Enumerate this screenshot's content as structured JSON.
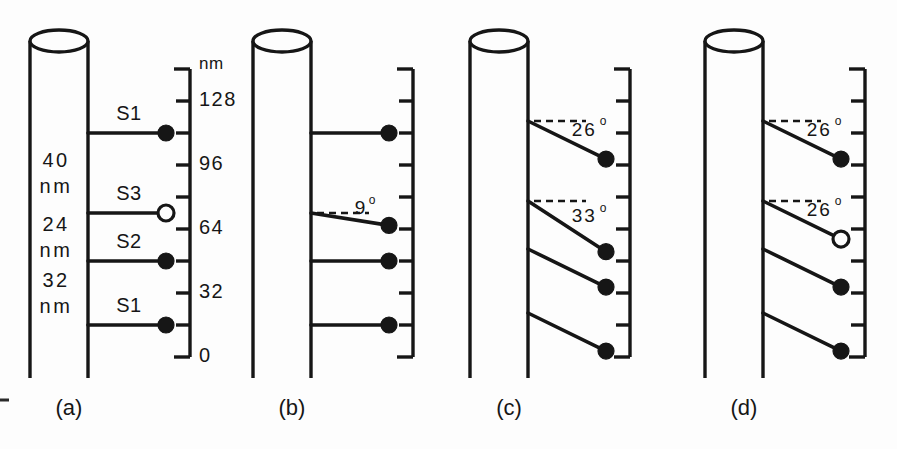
{
  "figure": {
    "background_color": "#fdfdfd",
    "ink_color": "#161616",
    "width": 897,
    "height": 449
  },
  "scale": {
    "unit_label": "nm",
    "axis_min": 0,
    "axis_max": 144,
    "tick_interval": 16,
    "labeled_ticks": [
      {
        "value": 128,
        "label": "128"
      },
      {
        "value": 96,
        "label": "96"
      },
      {
        "value": 64,
        "label": "64"
      },
      {
        "value": 32,
        "label": "32"
      },
      {
        "value": 0,
        "label": "0"
      }
    ],
    "all_tick_values": [
      0,
      16,
      32,
      48,
      64,
      80,
      96,
      112,
      128,
      144
    ]
  },
  "dimension_labels": [
    {
      "value": "40",
      "unit": "nm",
      "span_nm": 40
    },
    {
      "value": "24",
      "unit": "nm",
      "span_nm": 24
    },
    {
      "value": "32",
      "unit": "nm",
      "span_nm": 32
    }
  ],
  "panels": [
    {
      "id": "a",
      "caption": "(a)",
      "has_scale_labels": true,
      "has_segment_labels": true,
      "has_dimension_labels": true,
      "markers": [
        {
          "index": 1,
          "label": "S1",
          "level_nm": 112,
          "angle_deg": 0,
          "angle_text": "",
          "dot": "filled",
          "dashed_ref": false
        },
        {
          "index": 2,
          "label": "S3",
          "level_nm": 72,
          "angle_deg": 0,
          "angle_text": "",
          "dot": "open",
          "dashed_ref": false
        },
        {
          "index": 3,
          "label": "S2",
          "level_nm": 48,
          "angle_deg": 0,
          "angle_text": "",
          "dot": "filled",
          "dashed_ref": false
        },
        {
          "index": 4,
          "label": "S1",
          "level_nm": 16,
          "angle_deg": 0,
          "angle_text": "",
          "dot": "filled",
          "dashed_ref": false
        }
      ]
    },
    {
      "id": "b",
      "caption": "(b)",
      "has_scale_labels": false,
      "has_segment_labels": false,
      "has_dimension_labels": false,
      "markers": [
        {
          "index": 1,
          "label": "",
          "level_nm": 112,
          "angle_deg": 0,
          "angle_text": "",
          "dot": "filled",
          "dashed_ref": false
        },
        {
          "index": 2,
          "label": "",
          "level_nm": 72,
          "angle_deg": 9,
          "angle_text": "9",
          "dot": "filled",
          "dashed_ref": true
        },
        {
          "index": 3,
          "label": "",
          "level_nm": 48,
          "angle_deg": 0,
          "angle_text": "",
          "dot": "filled",
          "dashed_ref": false
        },
        {
          "index": 4,
          "label": "",
          "level_nm": 16,
          "angle_deg": 0,
          "angle_text": "",
          "dot": "filled",
          "dashed_ref": false
        }
      ]
    },
    {
      "id": "c",
      "caption": "(c)",
      "has_scale_labels": false,
      "has_segment_labels": false,
      "has_dimension_labels": false,
      "markers": [
        {
          "index": 1,
          "label": "",
          "level_nm": 118,
          "angle_deg": 26,
          "angle_text": "26",
          "dot": "filled",
          "dashed_ref": true
        },
        {
          "index": 2,
          "label": "",
          "level_nm": 78,
          "angle_deg": 33,
          "angle_text": "33",
          "dot": "filled",
          "dashed_ref": true
        },
        {
          "index": 3,
          "label": "",
          "level_nm": 54,
          "angle_deg": 26,
          "angle_text": "",
          "dot": "filled",
          "dashed_ref": false
        },
        {
          "index": 4,
          "label": "",
          "level_nm": 22,
          "angle_deg": 26,
          "angle_text": "",
          "dot": "filled",
          "dashed_ref": false
        }
      ]
    },
    {
      "id": "d",
      "caption": "(d)",
      "has_scale_labels": false,
      "has_segment_labels": false,
      "has_dimension_labels": false,
      "markers": [
        {
          "index": 1,
          "label": "",
          "level_nm": 118,
          "angle_deg": 26,
          "angle_text": "26",
          "dot": "filled",
          "dashed_ref": true
        },
        {
          "index": 2,
          "label": "",
          "level_nm": 78,
          "angle_deg": 26,
          "angle_text": "26",
          "dot": "open",
          "dashed_ref": true
        },
        {
          "index": 3,
          "label": "",
          "level_nm": 54,
          "angle_deg": 26,
          "angle_text": "",
          "dot": "filled",
          "dashed_ref": false
        },
        {
          "index": 4,
          "label": "",
          "level_nm": 22,
          "angle_deg": 26,
          "angle_text": "",
          "dot": "filled",
          "dashed_ref": false
        }
      ]
    }
  ],
  "degree_symbol": "o"
}
